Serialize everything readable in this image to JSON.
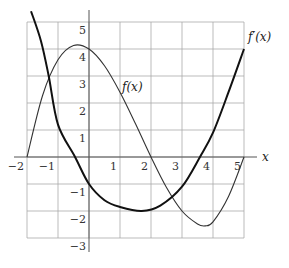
{
  "chart_data": {
    "type": "line",
    "title": "",
    "xlabel": "x",
    "ylabel": "",
    "xlim": [
      -2,
      5
    ],
    "ylim": [
      -3,
      5
    ],
    "grid": true,
    "x_ticks": [
      "-2",
      "-1",
      "1",
      "2",
      "3",
      "4",
      "5"
    ],
    "y_ticks": [
      "5",
      "4",
      "3",
      "2",
      "1",
      "-1",
      "-2",
      "-3"
    ],
    "series": [
      {
        "name": "f(x)",
        "style": "thin",
        "x": [
          -2,
          -1.5,
          -1,
          -0.5,
          0,
          0.5,
          1,
          1.5,
          2,
          2.5,
          3,
          3.5,
          3.75,
          4,
          4.5,
          5
        ],
        "y": [
          0,
          2.27,
          3.6,
          4.13,
          4.0,
          3.38,
          2.4,
          1.23,
          0,
          -1.13,
          -2.0,
          -2.48,
          -2.55,
          -2.4,
          -1.46,
          0
        ]
      },
      {
        "name": "f'(x)",
        "style": "thick",
        "x": [
          -1.87,
          -1.55,
          -1.3,
          -1,
          -0.45,
          0,
          0.5,
          1,
          1.7,
          2.3,
          3,
          3.58,
          4,
          4.5,
          5
        ],
        "y": [
          5.4,
          4.3,
          3.0,
          1.2,
          0,
          -1.0,
          -1.6,
          -1.85,
          -2.0,
          -1.8,
          -1.1,
          0,
          0.9,
          2.4,
          4.0
        ]
      }
    ],
    "annotations": [
      {
        "text": "f(x)",
        "x": 1.2,
        "y": 2.8
      },
      {
        "text": "f'(x)",
        "x": 5.2,
        "y": 4.6
      }
    ]
  },
  "labels": {
    "f": "f(x)",
    "fprime": "f′(x)",
    "xaxis": "x",
    "xt": [
      "−2",
      "−1",
      "1",
      "2",
      "3",
      "4",
      "5"
    ],
    "yt": [
      "5",
      "4",
      "3",
      "2",
      "1",
      "−1",
      "−2",
      "−3"
    ]
  }
}
